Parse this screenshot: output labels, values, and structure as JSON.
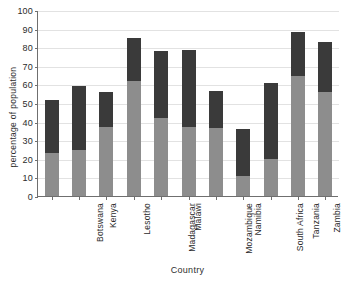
{
  "chart_data": {
    "type": "bar",
    "subtype": "stacked-vertical",
    "title": "",
    "xlabel": "Country",
    "ylabel": "percentage of population",
    "ylim": [
      0,
      100
    ],
    "ytick_step": 10,
    "yticks": [
      0,
      10,
      20,
      30,
      40,
      50,
      60,
      70,
      80,
      90,
      100
    ],
    "grid": true,
    "grid_axis": "y",
    "legend": null,
    "legend_position": "none",
    "categories": [
      "Botswana",
      "Kenya",
      "Lesotho",
      "Madagascar",
      "Malawi",
      "Mozambique",
      "Namibia",
      "South Africa",
      "Tanzania",
      "Zambia",
      "Zimbabwe"
    ],
    "series": [
      {
        "name": "lower segment",
        "color": "#8d8d8d",
        "values": [
          23,
          24.5,
          37,
          62,
          42,
          37,
          36.5,
          10.5,
          20,
          64.5,
          56
        ]
      },
      {
        "name": "upper segment",
        "color": "#3a3a3a",
        "values": [
          28.5,
          34.5,
          19,
          23,
          36,
          41.5,
          20,
          25.5,
          40.5,
          23.5,
          27
        ]
      }
    ],
    "totals": [
      51.5,
      59,
      56,
      85,
      78,
      78.5,
      56.5,
      36,
      60.5,
      88,
      83
    ]
  },
  "colors": {
    "segment_low": "#8d8d8d",
    "segment_high": "#3a3a3a",
    "axis": "#6f6f6f",
    "grid": "#e2e2e2",
    "text": "#2b2b2b",
    "background": "#ffffff"
  }
}
